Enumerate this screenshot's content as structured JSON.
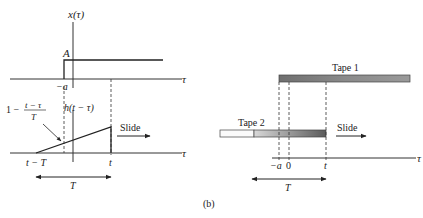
{
  "figure_label": "(b)",
  "left_panel": {
    "top_plot": {
      "y_axis_label": "x(τ)",
      "amplitude_label": "A",
      "step_start_label": "−a",
      "x_axis_label": "τ"
    },
    "bottom_plot": {
      "ramp_label_num": "t − τ",
      "ramp_label_prefix": "1 −",
      "ramp_label_den": "T",
      "kernel_label": "h(t − τ)",
      "slide_label": "Slide",
      "x_axis_label": "τ",
      "left_tick": "t − T",
      "right_tick": "t",
      "span_label": "T"
    }
  },
  "right_panel": {
    "tape1_label": "Tape 1",
    "tape2_label": "Tape 2",
    "slide_label": "Slide",
    "x_axis_label": "τ",
    "ticks": [
      "−a",
      "0",
      "t"
    ],
    "span_label": "T"
  }
}
